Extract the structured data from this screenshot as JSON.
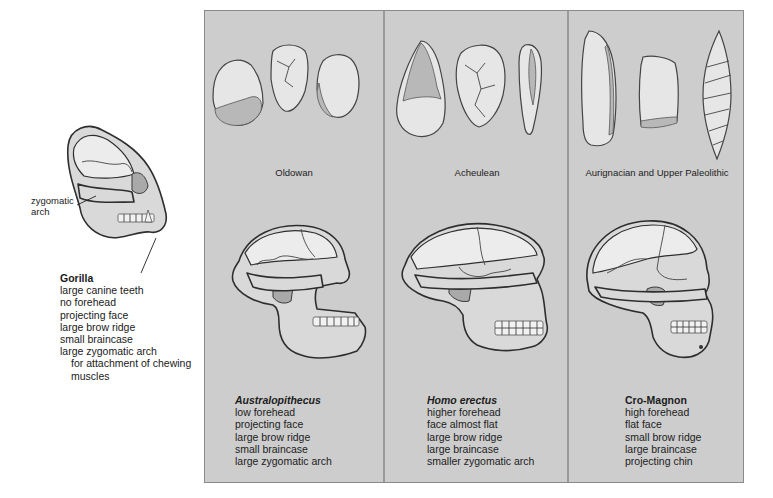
{
  "gorilla": {
    "label_callout": [
      "zygomatic",
      "arch"
    ],
    "title": "Gorilla",
    "traits": [
      "large canine teeth",
      "no forehead",
      "projecting face",
      "large brow ridge",
      "small braincase",
      "large zygomatic arch"
    ],
    "trait_note": [
      "for attachment of chewing",
      "muscles"
    ]
  },
  "columns": [
    {
      "tool_period": "Oldowan",
      "species": "Australopithecus",
      "species_italic": true,
      "traits": [
        "low forehead",
        "projecting face",
        "large brow ridge",
        "small braincase",
        "large zygomatic arch"
      ]
    },
    {
      "tool_period": "Acheulean",
      "species": "Homo erectus",
      "species_italic": true,
      "traits": [
        "higher forehead",
        "face almost flat",
        "large brow ridge",
        "large braincase",
        "smaller zygomatic arch"
      ]
    },
    {
      "tool_period": "Aurignacian and Upper Paleolithic",
      "species": "Cro-Magnon",
      "species_italic": false,
      "traits": [
        "high forehead",
        "flat face",
        "small brow ridge",
        "large braincase",
        "projecting chin"
      ]
    }
  ],
  "colors": {
    "panel_bg": "#cdcdcd",
    "panel_border": "#8a8a8a",
    "text": "#1a1a1a"
  }
}
